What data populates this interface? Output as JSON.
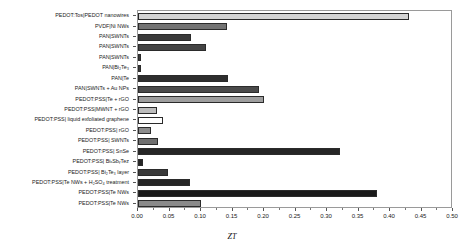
{
  "chart_data": {
    "type": "bar",
    "orientation": "horizontal",
    "title": "",
    "xlabel": "ZT",
    "ylabel": "",
    "xlim": [
      0.0,
      0.5
    ],
    "xticks": [
      "0.00",
      "0.05",
      "0.10",
      "0.15",
      "0.20",
      "0.25",
      "0.30",
      "0.35",
      "0.40",
      "0.45",
      "0.50"
    ],
    "xtick_values": [
      0.0,
      0.05,
      0.1,
      0.15,
      0.2,
      0.25,
      0.3,
      0.35,
      0.4,
      0.45,
      0.5
    ],
    "grid": false,
    "legend": "none",
    "categories": [
      "PEDOT:Tos|PEDOT nanowires",
      "PVDF|Ni NWs",
      "PAN|SWNTs",
      "PAN|SWNTs",
      "PAN|SWNTs",
      "PAN|Bi₂Te₃",
      "PAN|Te",
      "PAN|SWNTs + Au NPs",
      "PEDOT:PSS|Te + rGO",
      "PEDOT:PSS|MWNT + rGO",
      "PEDOT:PSS| liquid exfoliated graphene",
      "PEDOT:PSS| rGO",
      "PEDOT:PSS| SWNTs",
      "PEDOT:PSS| SnSe",
      "PEDOT:PSS| BiₓSbᵧTeᴢ",
      "PEDOT:PSS| Bi₂Te₃ layer",
      "PEDOT:PSS|Te NWs + H₂SO₄ treatment",
      "PEDOT:PSS|Te NWs",
      "PEDOT:PSS|Te NWs"
    ],
    "values": [
      0.43,
      0.141,
      0.084,
      0.108,
      0.004,
      0.004,
      0.143,
      0.192,
      0.2,
      0.03,
      0.04,
      0.021,
      0.032,
      0.32,
      0.008,
      0.048,
      0.082,
      0.38,
      0.1
    ],
    "bar_colors": [
      "#d4d4d4",
      "#737373",
      "#3a3a3a",
      "#444444",
      "#3a3a3a",
      "#3a3a3a",
      "#2e2e2e",
      "#4a4a4a",
      "#9e9e9e",
      "#bdbdbd",
      "#ffffff",
      "#8c8c8c",
      "#6f6f6f",
      "#262626",
      "#262626",
      "#3a3a3a",
      "#262626",
      "#1a1a1a",
      "#8a8a8a"
    ]
  }
}
